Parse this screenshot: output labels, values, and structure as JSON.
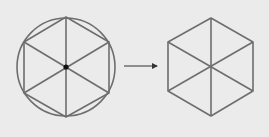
{
  "diagram": {
    "background": "#ebebeb",
    "stroke_color": "#6e6e6e",
    "center_dot_color": "#111111",
    "left_figure": {
      "description": "regular hexagon inscribed in circle with center point and three diagonals",
      "circle": {
        "cx": 66,
        "cy": 67,
        "r": 49
      },
      "center": {
        "x": 66,
        "y": 67
      },
      "vertices": [
        [
          66,
          17
        ],
        [
          109,
          42
        ],
        [
          109,
          93
        ],
        [
          66,
          117
        ],
        [
          24,
          93
        ],
        [
          24,
          42
        ]
      ]
    },
    "arrow": {
      "x1": 124,
      "y1": 66,
      "x2": 160,
      "y2": 66
    },
    "right_figure": {
      "description": "regular hexagon with three diagonals through center",
      "center": {
        "x": 211,
        "y": 67
      },
      "vertices": [
        [
          211,
          18
        ],
        [
          253,
          42
        ],
        [
          253,
          91
        ],
        [
          211,
          116
        ],
        [
          168,
          91
        ],
        [
          168,
          42
        ]
      ]
    }
  }
}
